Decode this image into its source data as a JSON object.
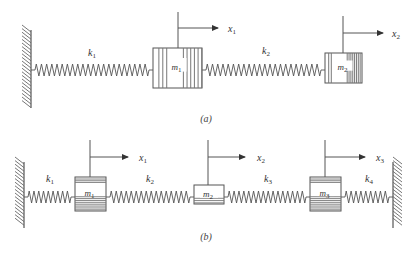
{
  "figure": {
    "stroke_color": "#555555",
    "hatch_color": "#666666",
    "panels": [
      {
        "id": "a",
        "caption": "(a)",
        "caption_pos": [
          206,
          122
        ],
        "axis_y": 70,
        "left_wall": {
          "x": 31,
          "y1": 30,
          "y2": 108,
          "side": "left"
        },
        "right_wall": null,
        "masses": [
          {
            "label": "m",
            "sub": "1",
            "x": 153,
            "y": 48,
            "w": 49,
            "h": 40,
            "hatch": "vertical-both-sides",
            "disp": {
              "label": "x",
              "sub": "1",
              "line_x": 178,
              "top": 12,
              "arrow_y": 28,
              "arrow_end": 218,
              "label_x": 228
            }
          },
          {
            "label": "m",
            "sub": "2",
            "x": 325,
            "y": 53,
            "w": 37,
            "h": 30,
            "hatch": "vertical-right-heavy",
            "disp": {
              "label": "x",
              "sub": "2",
              "line_x": 343,
              "top": 16,
              "arrow_y": 33,
              "arrow_end": 383,
              "label_x": 392
            }
          }
        ],
        "springs": [
          {
            "label": "k",
            "sub": "1",
            "x1": 31,
            "x2": 153,
            "coils": 22,
            "label_x": 88,
            "label_y": 56
          },
          {
            "label": "k",
            "sub": "2",
            "x1": 202,
            "x2": 325,
            "coils": 22,
            "label_x": 262,
            "label_y": 54
          }
        ]
      },
      {
        "id": "b",
        "caption": "(b)",
        "caption_pos": [
          206,
          240
        ],
        "axis_y": 197,
        "left_wall": {
          "x": 24,
          "y1": 162,
          "y2": 228,
          "side": "left"
        },
        "right_wall": {
          "x": 393,
          "y1": 162,
          "y2": 228,
          "side": "right"
        },
        "masses": [
          {
            "label": "m",
            "sub": "1",
            "x": 75,
            "y": 177,
            "w": 31,
            "h": 34,
            "hatch": "horizontal-top-bottom-heavy",
            "disp": {
              "label": "x",
              "sub": "1",
              "line_x": 90,
              "top": 140,
              "arrow_y": 157,
              "arrow_end": 128,
              "label_x": 139
            }
          },
          {
            "label": "m",
            "sub": "2",
            "x": 194,
            "y": 185,
            "w": 30,
            "h": 19,
            "hatch": "horizontal-bottom",
            "disp": {
              "label": "x",
              "sub": "2",
              "line_x": 208,
              "top": 140,
              "arrow_y": 157,
              "arrow_end": 245,
              "label_x": 257
            }
          },
          {
            "label": "m",
            "sub": "3",
            "x": 310,
            "y": 177,
            "w": 31,
            "h": 34,
            "hatch": "horizontal-top-bottom-heavy",
            "disp": {
              "label": "x",
              "sub": "3",
              "line_x": 325,
              "top": 140,
              "arrow_y": 157,
              "arrow_end": 365,
              "label_x": 376
            }
          }
        ],
        "springs": [
          {
            "label": "k",
            "sub": "1",
            "x1": 24,
            "x2": 75,
            "coils": 9,
            "label_x": 46,
            "label_y": 182
          },
          {
            "label": "k",
            "sub": "2",
            "x1": 106,
            "x2": 194,
            "coils": 16,
            "label_x": 146,
            "label_y": 182
          },
          {
            "label": "k",
            "sub": "3",
            "x1": 224,
            "x2": 310,
            "coils": 16,
            "label_x": 264,
            "label_y": 182
          },
          {
            "label": "k",
            "sub": "4",
            "x1": 341,
            "x2": 393,
            "coils": 9,
            "label_x": 365,
            "label_y": 182
          }
        ]
      }
    ]
  }
}
